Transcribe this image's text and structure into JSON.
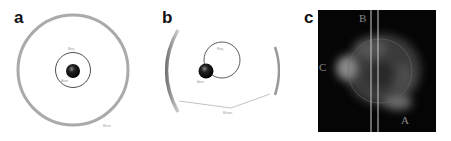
{
  "panels": {
    "a": {
      "label": "a",
      "ring_label": "Ring",
      "sphere_label": "Atom",
      "outer_label": "Mirror"
    },
    "b": {
      "label": "b",
      "ring_label": "Ring",
      "sphere_label": "Atom",
      "bottom_label": "Mirrors"
    },
    "c": {
      "label": "c",
      "markers": [
        "B",
        "C",
        "A"
      ]
    }
  }
}
